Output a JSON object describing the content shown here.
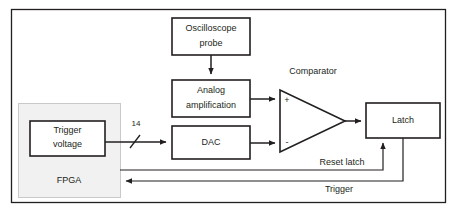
{
  "diagram": {
    "colors": {
      "line": "#231f20",
      "fpga_fill": "#f1f1f1",
      "fpga_border": "#c9c9c9",
      "background": "#ffffff"
    },
    "blocks": {
      "oscilloscope_probe": {
        "line1": "Oscilloscope",
        "line2": "probe"
      },
      "analog_amplification": {
        "line1": "Analog",
        "line2": "amplification"
      },
      "dac": {
        "label": "DAC"
      },
      "trigger_voltage": {
        "line1": "Trigger",
        "line2": "voltage"
      },
      "latch": {
        "label": "Latch"
      },
      "fpga": {
        "label": "FPGA"
      }
    },
    "labels": {
      "comparator": "Comparator",
      "reset_latch": "Reset latch",
      "trigger": "Trigger",
      "bus_width": "14",
      "plus_input": "+",
      "minus_input": "-"
    }
  }
}
